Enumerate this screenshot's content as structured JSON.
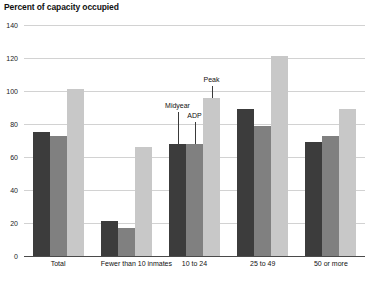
{
  "chart_data": {
    "type": "bar",
    "title": "Percent of capacity occupied",
    "xlabel": "",
    "ylabel": "",
    "ylim": [
      0,
      140
    ],
    "yticks": [
      0,
      20,
      40,
      60,
      80,
      100,
      120,
      140
    ],
    "grid": true,
    "legend_position": "inline-annotations",
    "categories": [
      "Total",
      "Fewer than 10 inmates",
      "10 to 24",
      "25 to 49",
      "50 or more"
    ],
    "series": [
      {
        "name": "Midyear",
        "color": "#3c3c3c",
        "values": [
          75,
          21,
          68,
          89,
          69
        ]
      },
      {
        "name": "ADP",
        "color": "#808080",
        "values": [
          73,
          17,
          68,
          79,
          73
        ]
      },
      {
        "name": "Peak",
        "color": "#c8c8c8",
        "values": [
          101,
          66,
          96,
          121,
          89
        ]
      }
    ],
    "annotations": [
      {
        "label": "Midyear",
        "series": "Midyear",
        "category": "10 to 24"
      },
      {
        "label": "ADP",
        "series": "ADP",
        "category": "10 to 24"
      },
      {
        "label": "Peak",
        "series": "Peak",
        "category": "10 to 24"
      }
    ]
  }
}
